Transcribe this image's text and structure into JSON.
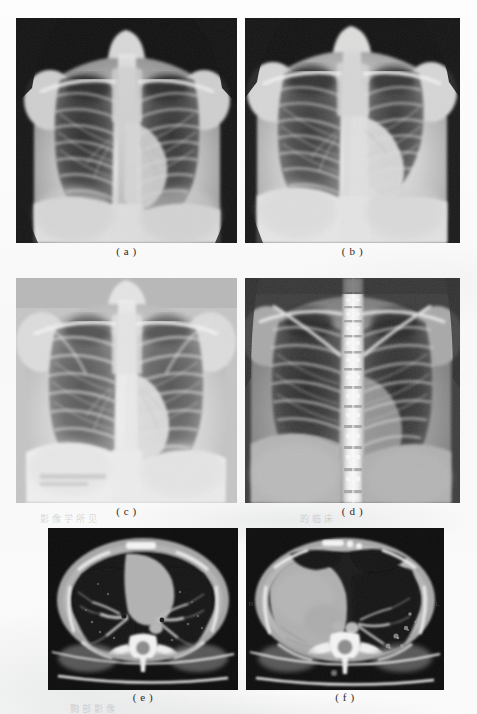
{
  "figure": {
    "kind": "medical-imaging-figure-plate",
    "layout": "2 columns x 3 rows",
    "background_color": "#fbfbfb",
    "panels": [
      {
        "id": "a",
        "caption": "( a )",
        "modality": "chest-radiograph",
        "view": "posteroanterior",
        "description": "Frontal chest X-ray, pediatric/young adult, dark collimated background, both lung fields visible with rib cage and clavicles",
        "x": 16,
        "y": 18,
        "width": 221,
        "height": 225
      },
      {
        "id": "b",
        "caption": "( b )",
        "modality": "chest-radiograph",
        "view": "posteroanterior",
        "description": "Frontal chest X-ray, brighter exposure, cardiac silhouette enlarged on left, costophrenic angles visible",
        "x": 245,
        "y": 18,
        "width": 215,
        "height": 225
      },
      {
        "id": "c",
        "caption": "( c )",
        "modality": "chest-radiograph",
        "view": "posteroanterior",
        "description": "Frontal chest X-ray, lighter overall density, full rib cage, scapulae overlying upper lung zones",
        "x": 16,
        "y": 278,
        "width": 221,
        "height": 225
      },
      {
        "id": "d",
        "caption": "( d )",
        "modality": "chest-radiograph",
        "view": "posteroanterior",
        "description": "High-contrast frontal chest X-ray with prominent bright thoracic spine column down the midline",
        "x": 245,
        "y": 278,
        "width": 215,
        "height": 225
      },
      {
        "id": "e",
        "caption": "( e )",
        "modality": "computed-tomography",
        "view": "axial-lung-window",
        "description": "Axial chest CT at level of pulmonary hila, lung window, both lungs aerated, vertebral body and table visible",
        "x": 48,
        "y": 528,
        "width": 190,
        "height": 162
      },
      {
        "id": "f",
        "caption": "( f )",
        "modality": "computed-tomography",
        "view": "axial-lung-window",
        "description": "Axial chest CT at lower thoracic level, large soft-tissue opacity occupying right hemithorax, vertebral body visible",
        "x": 246,
        "y": 528,
        "width": 198,
        "height": 162
      }
    ],
    "captions_row_y": [
      251,
      251,
      511,
      511,
      697,
      697
    ],
    "ghost_marks": [
      {
        "text": "影像学所见",
        "x": 40,
        "y": 512,
        "size": 8
      },
      {
        "text": "的临床",
        "x": 300,
        "y": 512,
        "size": 8
      },
      {
        "text": "胸部影像",
        "x": 70,
        "y": 705,
        "size": 8
      }
    ]
  }
}
